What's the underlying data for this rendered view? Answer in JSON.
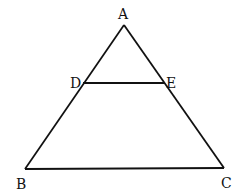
{
  "diagram": {
    "type": "triangle-with-parallel-segment",
    "points": {
      "A": {
        "label": "A",
        "x": 124,
        "y": 25
      },
      "B": {
        "label": "B",
        "x": 25,
        "y": 169
      },
      "C": {
        "label": "C",
        "x": 224,
        "y": 168
      },
      "D": {
        "label": "D",
        "x": 83,
        "y": 83
      },
      "E": {
        "label": "E",
        "x": 165,
        "y": 83
      }
    },
    "segments": [
      "AB",
      "AC",
      "BC",
      "DE"
    ],
    "stroke_color": "#111111"
  }
}
